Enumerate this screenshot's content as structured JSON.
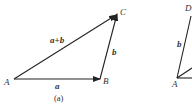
{
  "figure": {
    "panel_a": {
      "caption": "(a)",
      "points": {
        "A": "A",
        "B": "B",
        "C": "C"
      },
      "vectors": {
        "ab": "a",
        "bc": "b",
        "ac": "a+b"
      }
    },
    "panel_b_partial": {
      "points": {
        "D": "D",
        "A": "A"
      },
      "vectors": {
        "ad": "b"
      }
    },
    "colors": {
      "stroke": "#222222",
      "text": "#333333",
      "background": "#ffffff"
    }
  }
}
